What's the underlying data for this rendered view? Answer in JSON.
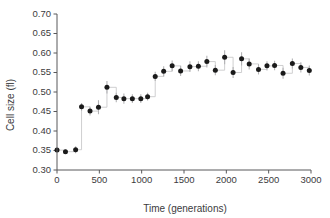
{
  "chart_data": {
    "type": "scatter",
    "title": "",
    "xlabel": "Time (generations)",
    "ylabel": "Cell size (fl)",
    "xlim": [
      0,
      3000
    ],
    "ylim": [
      0.3,
      0.7
    ],
    "xticks": [
      0,
      500,
      1000,
      1500,
      2000,
      2500,
      3000
    ],
    "xtick_labels": [
      "0",
      "500",
      "1000",
      "1500",
      "2000",
      "2500",
      "3000"
    ],
    "yticks": [
      0.3,
      0.35,
      0.4,
      0.45,
      0.5,
      0.55,
      0.6,
      0.65,
      0.7
    ],
    "ytick_labels": [
      "0.30",
      "0.35",
      "0.40",
      "0.45",
      "0.50",
      "0.55",
      "0.60",
      "0.65",
      "0.70"
    ],
    "grid": false,
    "legend": "none",
    "marker_color": "#1a1a1a",
    "errorbar_color": "#b3b3b5",
    "connector_color": "#c9c9cb",
    "axis_color": "#58585a",
    "series": [
      {
        "name": "Cell size",
        "x": [
          0,
          100,
          220,
          290,
          390,
          490,
          590,
          700,
          790,
          890,
          990,
          1070,
          1160,
          1260,
          1360,
          1460,
          1570,
          1670,
          1770,
          1870,
          1980,
          2080,
          2180,
          2270,
          2380,
          2480,
          2570,
          2670,
          2780,
          2880,
          2980
        ],
        "y": [
          0.351,
          0.347,
          0.352,
          0.462,
          0.451,
          0.461,
          0.512,
          0.486,
          0.483,
          0.483,
          0.483,
          0.488,
          0.54,
          0.553,
          0.567,
          0.554,
          0.565,
          0.566,
          0.578,
          0.556,
          0.589,
          0.55,
          0.585,
          0.572,
          0.558,
          0.567,
          0.568,
          0.548,
          0.573,
          0.563,
          0.555
        ],
        "yerr": [
          0.004,
          0.005,
          0.009,
          0.01,
          0.011,
          0.018,
          0.016,
          0.012,
          0.013,
          0.011,
          0.011,
          0.01,
          0.012,
          0.013,
          0.014,
          0.013,
          0.014,
          0.013,
          0.015,
          0.013,
          0.018,
          0.014,
          0.017,
          0.014,
          0.013,
          0.012,
          0.012,
          0.014,
          0.013,
          0.013,
          0.013
        ]
      }
    ]
  },
  "figure": {
    "xlabel": "Time (generations)",
    "ylabel": "Cell size (fl)"
  }
}
